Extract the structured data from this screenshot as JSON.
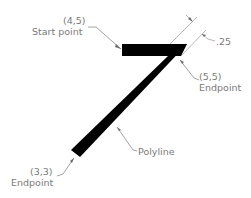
{
  "diagram": {
    "type": "annotated-cad-polyline",
    "colors": {
      "polyline": "#000000",
      "annotation_text": "#7a7a7a",
      "leader_line": "#8a8a8a",
      "background": "#ffffff"
    },
    "labels": {
      "start_point": {
        "coord": "(4,5)",
        "text": "Start point"
      },
      "end_point_top": {
        "coord": "(5,5)",
        "text": "Endpoint"
      },
      "end_point_bottom": {
        "coord": "(3,3)",
        "text": "Endpoint"
      },
      "polyline": {
        "text": "Polyline"
      },
      "width_dimension": {
        "text": ".25"
      }
    },
    "points": [
      {
        "name": "start",
        "x": 4,
        "y": 5
      },
      {
        "name": "corner",
        "x": 5,
        "y": 5
      },
      {
        "name": "end",
        "x": 3,
        "y": 3
      }
    ],
    "line_width": 0.25
  }
}
